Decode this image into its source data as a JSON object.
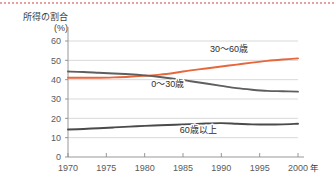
{
  "decoration": {
    "top_rule_color": "#e8a0a0",
    "top_rule_name": "dotted-top-rule"
  },
  "axis": {
    "y_title_line1": "所得の割合",
    "y_title_line2": "(%)",
    "x_unit": "年"
  },
  "chart_data": {
    "type": "line",
    "title": "",
    "subtitle": "",
    "xlabel": "年",
    "ylabel": "所得の割合 (%)",
    "xlim": [
      1970,
      2000
    ],
    "ylim": [
      0,
      60
    ],
    "xticks": [
      1970,
      1975,
      1980,
      1985,
      1990,
      1995,
      2000
    ],
    "xtick_labels": [
      "1970",
      "1975",
      "1980",
      "1985",
      "1990",
      "1995",
      "2000"
    ],
    "yticks": [
      0,
      10,
      20,
      30,
      40,
      50,
      60
    ],
    "ytick_labels": [
      "0",
      "10",
      "20",
      "30",
      "40",
      "50",
      "60"
    ],
    "grid": true,
    "grid_axis": "y",
    "grid_color": "#c8c8c8",
    "legend": "inline-labels",
    "x": [
      1970,
      1972,
      1974,
      1976,
      1978,
      1980,
      1982,
      1984,
      1986,
      1988,
      1990,
      1992,
      1994,
      1996,
      1998,
      2000
    ],
    "series": [
      {
        "name": "30〜60歳",
        "color": "#e8663c",
        "label_x": 1991,
        "label_y": 54.5,
        "values": [
          41.0,
          41.0,
          41.0,
          41.2,
          41.5,
          42.0,
          42.6,
          43.6,
          44.8,
          45.8,
          46.8,
          47.8,
          48.8,
          49.7,
          50.4,
          51.0
        ]
      },
      {
        "name": "0〜30歳",
        "color": "#5e5e5e",
        "label_x": 1983,
        "label_y": 36.0,
        "values": [
          44.2,
          44.0,
          43.6,
          43.2,
          42.8,
          42.2,
          41.4,
          40.4,
          39.2,
          38.0,
          36.8,
          35.6,
          34.8,
          34.2,
          34.0,
          33.8
        ]
      },
      {
        "name": "60歳以上",
        "color": "#4a4a4a",
        "label_x": 1987,
        "label_y": 12.5,
        "values": [
          14.2,
          14.5,
          14.9,
          15.3,
          15.7,
          16.1,
          16.4,
          16.7,
          17.0,
          17.3,
          17.5,
          17.2,
          16.9,
          16.8,
          16.9,
          17.2
        ]
      }
    ]
  }
}
